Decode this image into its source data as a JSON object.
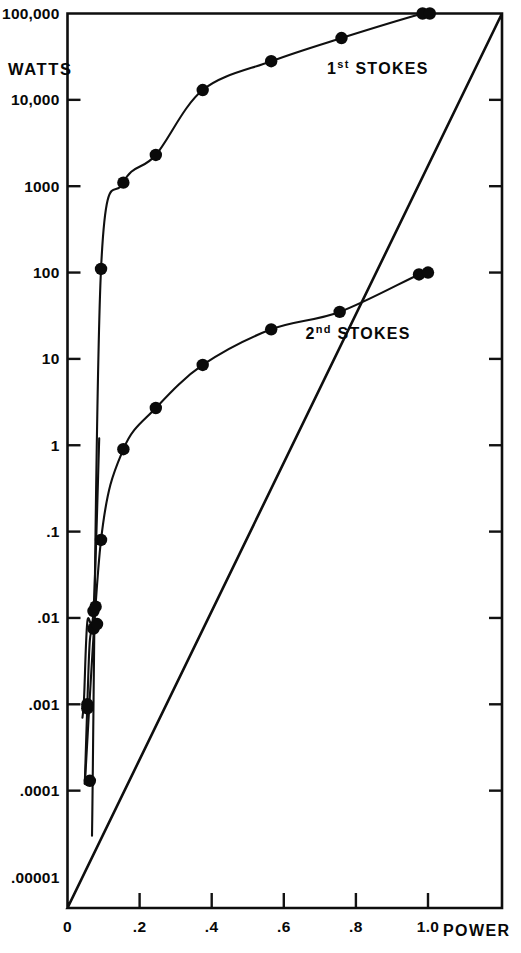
{
  "figure": {
    "unit_label": "WATTS",
    "x_axis_name": "POWER"
  },
  "chart_data": {
    "type": "scatter",
    "title": "",
    "subtitle": "",
    "xlabel": "POWER",
    "ylabel": "WATTS",
    "yscale": "log",
    "xscale": "linear",
    "grid": false,
    "legend_position": "inline-annotation",
    "xlim": [
      0,
      1.12
    ],
    "ylim": [
      1e-05,
      100000
    ],
    "xticks": [
      0,
      0.2,
      0.4,
      0.6,
      0.8,
      1.0
    ],
    "xticklabels": [
      "0",
      ".2",
      ".4",
      ".6",
      ".8",
      "1.0"
    ],
    "yticks": [
      1e-05,
      0.0001,
      0.001,
      0.01,
      0.1,
      1,
      10,
      100,
      1000,
      10000,
      100000
    ],
    "yticklabels": [
      ".00001",
      ".0001",
      ".001",
      ".01",
      ".1",
      "1",
      "10",
      "100",
      "1000",
      "10,000",
      "100,000"
    ],
    "annotations": [
      {
        "text": "1st STOKES",
        "base": "1",
        "sup": "st",
        "rest": " STOKES",
        "x": 0.72,
        "y": 20000
      },
      {
        "text": "2nd STOKES",
        "base": "2",
        "sup": "nd",
        "rest": " STOKES",
        "x": 0.66,
        "y": 17
      }
    ],
    "series": [
      {
        "name": "1st STOKES",
        "marker": "filled-circle",
        "color": "#0a0a0a",
        "x": [
          0.055,
          0.072,
          0.078,
          0.093,
          0.155,
          0.245,
          0.375,
          0.565,
          0.76,
          0.985,
          1.005
        ],
        "y": [
          0.0009,
          0.012,
          0.0135,
          110,
          1100,
          2300,
          13000,
          28000,
          52000,
          100000,
          100000
        ]
      },
      {
        "name": "2nd STOKES",
        "marker": "filled-circle",
        "color": "#0a0a0a",
        "x": [
          0.055,
          0.062,
          0.072,
          0.082,
          0.093,
          0.155,
          0.245,
          0.375,
          0.565,
          0.755,
          0.975,
          1.0
        ],
        "y": [
          0.001,
          0.00013,
          0.0075,
          0.0085,
          0.08,
          0.9,
          2.7,
          8.5,
          22,
          35,
          95,
          100
        ]
      }
    ]
  }
}
